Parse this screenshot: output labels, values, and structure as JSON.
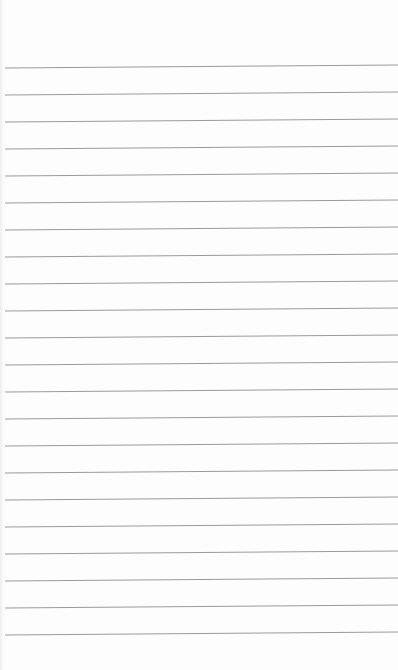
{
  "image": {
    "subject": "blank lined notebook paper",
    "background_color": "#fdfdfd",
    "line_color": "#9a9a9a",
    "line_count": 22,
    "line_spacing_px": 27,
    "first_line_y": 67,
    "line_start_x": 5,
    "line_tilt_px": -3
  }
}
